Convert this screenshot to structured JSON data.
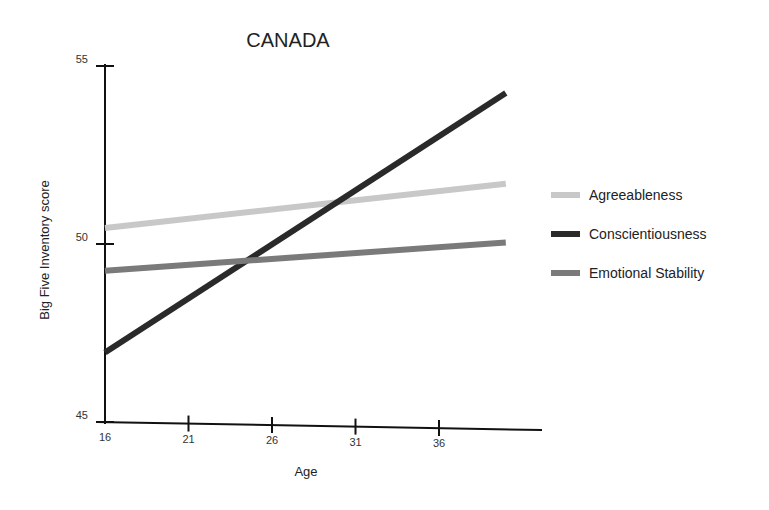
{
  "chart_data": {
    "type": "line",
    "title": "CANADA",
    "xlabel": "Age",
    "ylabel": "Big Five Inventory score",
    "x_ticks": [
      16,
      21,
      26,
      31,
      36
    ],
    "y_ticks": [
      45,
      50,
      55
    ],
    "xlim": [
      16,
      40
    ],
    "ylim": [
      45,
      55
    ],
    "grid": false,
    "legend_position": "right",
    "x": [
      16,
      40
    ],
    "series": [
      {
        "name": "Agreeableness",
        "color": "#c8c8c8",
        "values": [
          50.45,
          51.9
        ]
      },
      {
        "name": "Conscientiousness",
        "color": "#2a2a2a",
        "values": [
          46.95,
          54.45
        ]
      },
      {
        "name": "Emotional Stability",
        "color": "#7a7a7a",
        "values": [
          49.25,
          50.25
        ]
      }
    ]
  }
}
